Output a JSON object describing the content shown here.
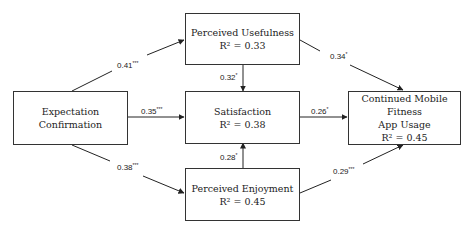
{
  "nodes": {
    "ec": {
      "line1": "Expectation",
      "line2": "Confirmation"
    },
    "pu": {
      "line1": "Perceived Usefulness",
      "line2": "R² = 0.33"
    },
    "sat": {
      "line1": "Satisfaction",
      "line2": "R² = 0.38"
    },
    "pe": {
      "line1": "Perceived Enjoyment",
      "line2": "R² = 0.45"
    },
    "cu": {
      "line1": "Continued Mobile Fitness",
      "line2": "App Usage",
      "line3": "R² = 0.45"
    }
  },
  "paths": {
    "ec_pu": {
      "coef": "0.41",
      "sig": "***"
    },
    "ec_sat": {
      "coef": "0.35",
      "sig": "***"
    },
    "ec_pe": {
      "coef": "0.38",
      "sig": "***"
    },
    "pu_sat": {
      "coef": "0.32",
      "sig": "*"
    },
    "pe_sat": {
      "coef": "0.28",
      "sig": "*"
    },
    "pu_cu": {
      "coef": "0.34",
      "sig": "*"
    },
    "sat_cu": {
      "coef": "0.26",
      "sig": "*"
    },
    "pe_cu": {
      "coef": "0.29",
      "sig": "***"
    }
  }
}
